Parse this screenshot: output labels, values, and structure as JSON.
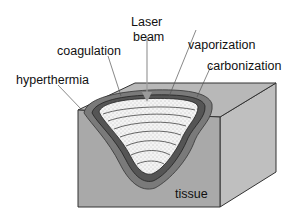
{
  "diagram": {
    "labels": {
      "laser_beam_line1": "Laser",
      "laser_beam_line2": "beam",
      "coagulation": "coagulation",
      "vaporization": "vaporization",
      "carbonization": "carbonization",
      "hyperthermia": "hyperthermia",
      "tissue": "tissue"
    },
    "colors": {
      "tissue_front": "#a9a9a9",
      "tissue_top": "#b8b8b8",
      "tissue_right": "#bfbfbf",
      "hyperthermia_zone": "#7a7a7a",
      "coagulation_zone": "#5a5a5a",
      "carbonization_line": "#2a2a2a",
      "vaporization_crater": "#f2f2f2",
      "outline": "#333333"
    }
  }
}
